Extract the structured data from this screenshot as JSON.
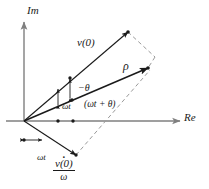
{
  "figure": {
    "type": "phasor-diagram",
    "background_color": "#ffffff",
    "stroke_color": "#1a1a1a",
    "axis_color": "#7f7f7f",
    "dashed_color": "#9a9a9a"
  },
  "axes": {
    "imaginary_label": "Im",
    "real_label": "Re",
    "origin": {
      "x": 24,
      "y": 121
    }
  },
  "vectors": [
    {
      "name": "v0-vector",
      "label": "v(0)",
      "from": {
        "x": 24,
        "y": 121
      },
      "to": {
        "x": 128,
        "y": 32
      }
    },
    {
      "name": "rho-vector",
      "label": "ρ",
      "from": {
        "x": 24,
        "y": 121
      },
      "to": {
        "x": 148,
        "y": 68
      }
    },
    {
      "name": "vdot-over-omega-vector",
      "label": "v̇(0)/ω",
      "from": {
        "x": 24,
        "y": 121
      },
      "to": {
        "x": 76,
        "y": 155
      }
    }
  ],
  "angles": [
    {
      "name": "minus-theta",
      "label": "−θ"
    },
    {
      "name": "omega-t-upper",
      "label": "ωt"
    },
    {
      "name": "omega-t-plus-theta",
      "label": "(ωt + θ)"
    },
    {
      "name": "omega-t-lower",
      "label": "ωt"
    }
  ],
  "fraction_label": {
    "numerator": "v(0)",
    "numerator_accent": "dot",
    "denominator": "ω"
  }
}
